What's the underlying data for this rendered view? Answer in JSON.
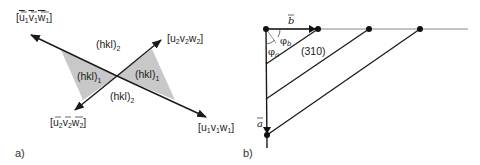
{
  "panel_a": {
    "label": "a)",
    "directions": {
      "d1_pos": {
        "u": "u",
        "v": "v",
        "w": "w",
        "idx": "1",
        "bar": false
      },
      "d1_neg": {
        "u": "u",
        "v": "v",
        "w": "w",
        "idx": "1",
        "bar": true
      },
      "d2_pos": {
        "u": "u",
        "v": "v",
        "w": "w",
        "idx": "2",
        "bar": false
      },
      "d2_neg": {
        "u": "u",
        "v": "v",
        "w": "w",
        "idx": "2",
        "bar": true
      }
    },
    "planes": {
      "hkl_base": "(hkl)",
      "plane1_sub": "1",
      "plane2_sub": "2"
    },
    "colors": {
      "shade": "#c8c8c8",
      "line": "#1a1a1a"
    }
  },
  "panel_b": {
    "label": "b)",
    "vector_a": "a",
    "vector_b": "b",
    "angle_a": "φ",
    "angle_a_sub": "a",
    "angle_b": "φ",
    "angle_b_sub": "b",
    "plane_label": "(310)",
    "colors": {
      "line": "#1a1a1a",
      "axis": "#888888",
      "dot": "#111111"
    }
  }
}
